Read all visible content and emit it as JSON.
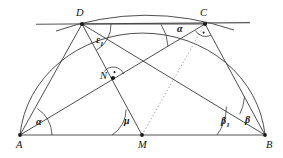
{
  "figure": {
    "type": "geometry-diagram",
    "background_color": "#ffffff",
    "stroke_color": "#2b2b2b",
    "points": [
      {
        "name": "A",
        "label": "A",
        "x": 20,
        "y": 135,
        "label_dx": -4,
        "label_dy": 6,
        "dot": true
      },
      {
        "name": "B",
        "label": "B",
        "x": 265,
        "y": 135,
        "label_dx": 1,
        "label_dy": 6,
        "dot": true
      },
      {
        "name": "M",
        "label": "M",
        "x": 142,
        "y": 135,
        "label_dx": -4,
        "label_dy": 6,
        "dot": true
      },
      {
        "name": "D",
        "label": "D",
        "x": 82,
        "y": 24,
        "label_dx": -4,
        "label_dy": -13,
        "dot": true
      },
      {
        "name": "C",
        "label": "C",
        "x": 205,
        "y": 24,
        "label_dx": -3,
        "label_dy": -13,
        "dot": true
      },
      {
        "name": "N",
        "label": "N",
        "x": 113,
        "y": 78,
        "label_dx": -12,
        "label_dy": -5,
        "dot": true
      }
    ],
    "segments": [
      {
        "name": "segment-AB",
        "from": "A",
        "to": "B",
        "style": "solid"
      },
      {
        "name": "segment-AD",
        "from": "A",
        "to": "D",
        "style": "solid"
      },
      {
        "name": "segment-AC",
        "from": "A",
        "to": "C",
        "style": "solid"
      },
      {
        "name": "segment-DM",
        "from": "D",
        "to": "M",
        "style": "solid"
      },
      {
        "name": "segment-DB",
        "from": "D",
        "to": "B",
        "style": "solid"
      },
      {
        "name": "segment-DC",
        "from": "D",
        "to": "C",
        "style": "solid"
      },
      {
        "name": "segment-CB",
        "from": "C",
        "to": "B",
        "style": "solid"
      },
      {
        "name": "segment-MC",
        "from": "M",
        "to": "C",
        "style": "dotted"
      }
    ],
    "tangent_line": {
      "name": "tangent-line-through-D-and-C",
      "x1": 36,
      "y1": 24,
      "x2": 250,
      "y2": 22
    },
    "arcs": [
      {
        "name": "semicircle-AB",
        "note": "large circular arc from A up through D to B"
      },
      {
        "name": "arc-D-to-C",
        "note": "shallow upper arc joining D and C above the tangent line"
      }
    ],
    "angle_labels": [
      {
        "name": "angle-alpha-at-A",
        "text": "α",
        "sub": "",
        "x": 36,
        "y": 120
      },
      {
        "name": "angle-alpha-at-C",
        "text": "α",
        "sub": "",
        "x": 177,
        "y": 27
      },
      {
        "name": "angle-epsilon-1-at-D",
        "text": "ε",
        "sub": "1",
        "x": 97,
        "y": 40
      },
      {
        "name": "angle-mu-at-M",
        "text": "μ",
        "sub": "",
        "x": 124,
        "y": 118
      },
      {
        "name": "angle-beta-1-at-B",
        "text": "β",
        "sub": "1",
        "x": 222,
        "y": 119
      },
      {
        "name": "angle-beta-at-B",
        "text": "β",
        "sub": "",
        "x": 245,
        "y": 118
      }
    ],
    "right_angle_markers": [
      {
        "name": "right-angle-marker-at-N",
        "at": "N",
        "note": "dot inside small arc indicating 90 degrees"
      },
      {
        "name": "right-angle-marker-at-C",
        "at": "C",
        "note": "dot inside small arc indicating 90 degrees"
      }
    ]
  }
}
